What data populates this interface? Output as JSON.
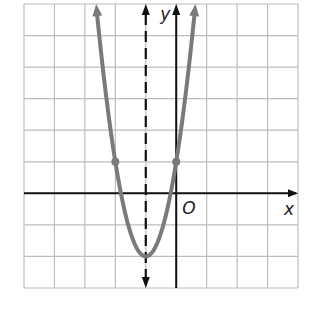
{
  "chart_data": {
    "type": "line",
    "title": "",
    "xlabel": "x",
    "ylabel": "y",
    "origin_label": "O",
    "xlim": [
      -5,
      4
    ],
    "ylim": [
      -3,
      6
    ],
    "grid": true,
    "grid_step": 1,
    "series": [
      {
        "name": "parabola",
        "equation": "y = 3(x + 1)^2 - 2",
        "color": "#7a7a7a",
        "vertex": [
          -1,
          -2
        ],
        "marked_points": [
          [
            -2,
            1
          ],
          [
            0,
            1
          ]
        ],
        "x": [
          -2.63,
          -2.5,
          -2,
          -1.5,
          -1,
          -0.5,
          0,
          0.5,
          0.63
        ],
        "y": [
          6,
          4.75,
          1,
          -1.25,
          -2,
          -1.25,
          1,
          4.75,
          6
        ]
      }
    ],
    "axis_of_symmetry": {
      "x": -1,
      "style": "dashed",
      "color": "#111111"
    },
    "colors": {
      "grid": "#bdbdbd",
      "axes": "#111111",
      "curve": "#7a7a7a"
    }
  }
}
